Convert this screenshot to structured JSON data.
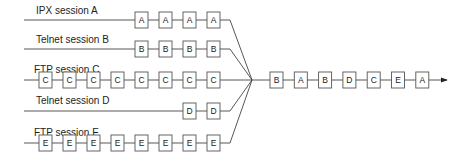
{
  "sessions": [
    {
      "label": "IPX session A",
      "packet": "A",
      "count": 4
    },
    {
      "label": "Telnet session B",
      "packet": "B",
      "count": 4
    },
    {
      "label": "FTP session C",
      "packet": "C",
      "count": 8
    },
    {
      "label": "Telnet session D",
      "packet": "D",
      "count": 2
    },
    {
      "label": "FTP session E",
      "packet": "E",
      "count": 8
    }
  ],
  "output_stream": [
    "B",
    "A",
    "B",
    "D",
    "C",
    "E",
    "A"
  ],
  "colors": {
    "line": "#444444",
    "box_border": "#555555",
    "text": "#222222"
  }
}
